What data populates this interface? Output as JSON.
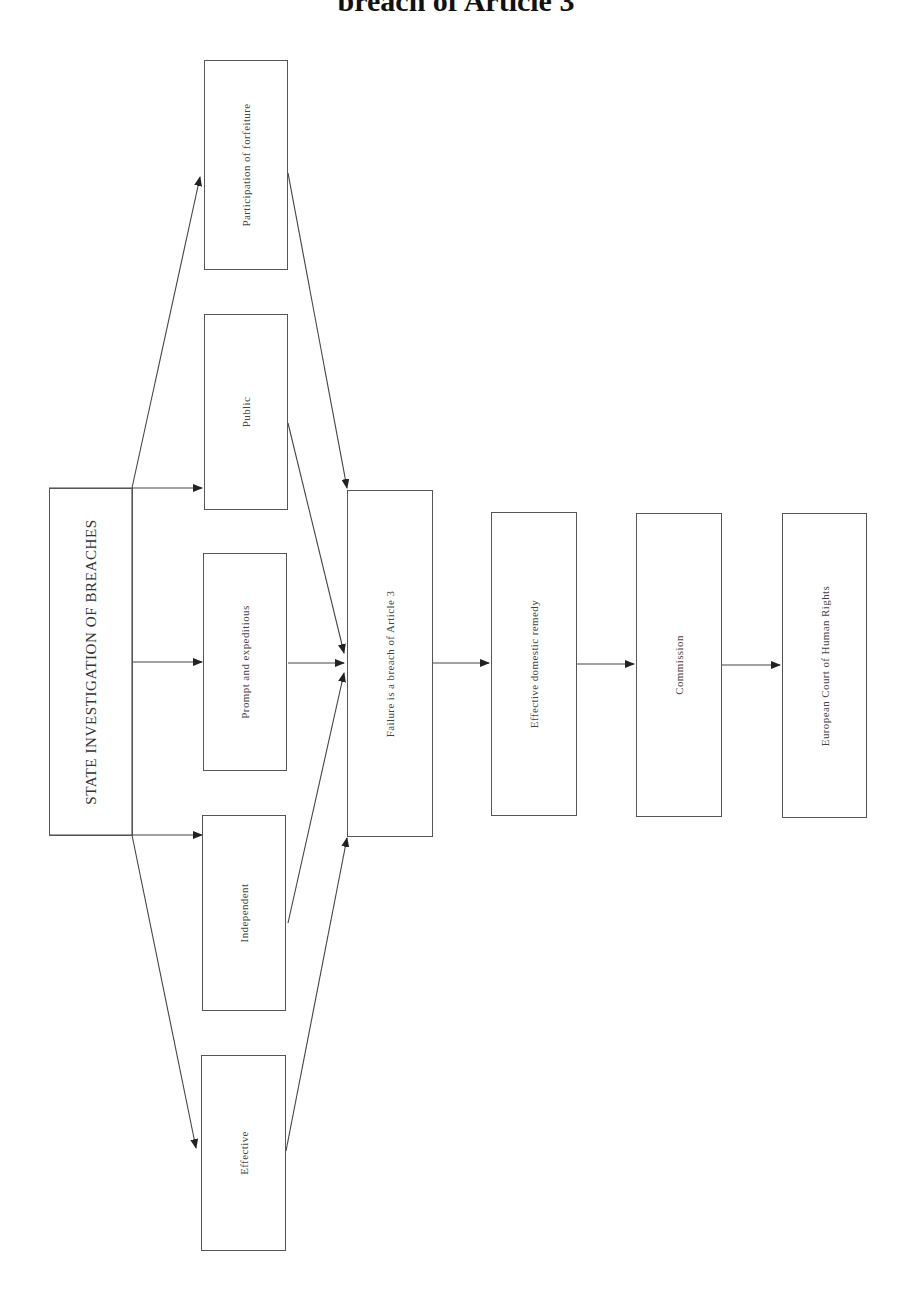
{
  "title": "breach of Article 3",
  "nodes": {
    "state": {
      "label": "STATE INVESTIGATION OF BREACHES"
    },
    "participation": {
      "label": "Participation of forfeiture"
    },
    "public": {
      "label": "Public"
    },
    "prompt": {
      "label": "Prompt and expeditious"
    },
    "independent": {
      "label": "Independent"
    },
    "effective": {
      "label": "Effective"
    },
    "failure": {
      "label": "Failure is a breach of Article 3"
    },
    "remedy": {
      "label": "Effective domestic remedy"
    },
    "commission": {
      "label": "Commission"
    },
    "echr": {
      "label": "European Court of Human Rights"
    }
  },
  "edges": [
    {
      "from": "state",
      "to": "participation"
    },
    {
      "from": "state",
      "to": "public"
    },
    {
      "from": "state",
      "to": "prompt"
    },
    {
      "from": "state",
      "to": "independent"
    },
    {
      "from": "state",
      "to": "effective"
    },
    {
      "from": "participation",
      "to": "failure"
    },
    {
      "from": "public",
      "to": "failure"
    },
    {
      "from": "prompt",
      "to": "failure"
    },
    {
      "from": "independent",
      "to": "failure"
    },
    {
      "from": "effective",
      "to": "failure"
    },
    {
      "from": "failure",
      "to": "remedy"
    },
    {
      "from": "remedy",
      "to": "commission"
    },
    {
      "from": "commission",
      "to": "echr"
    }
  ],
  "colors": {
    "line": "#444444",
    "text": "#444444",
    "title": "#111111"
  }
}
